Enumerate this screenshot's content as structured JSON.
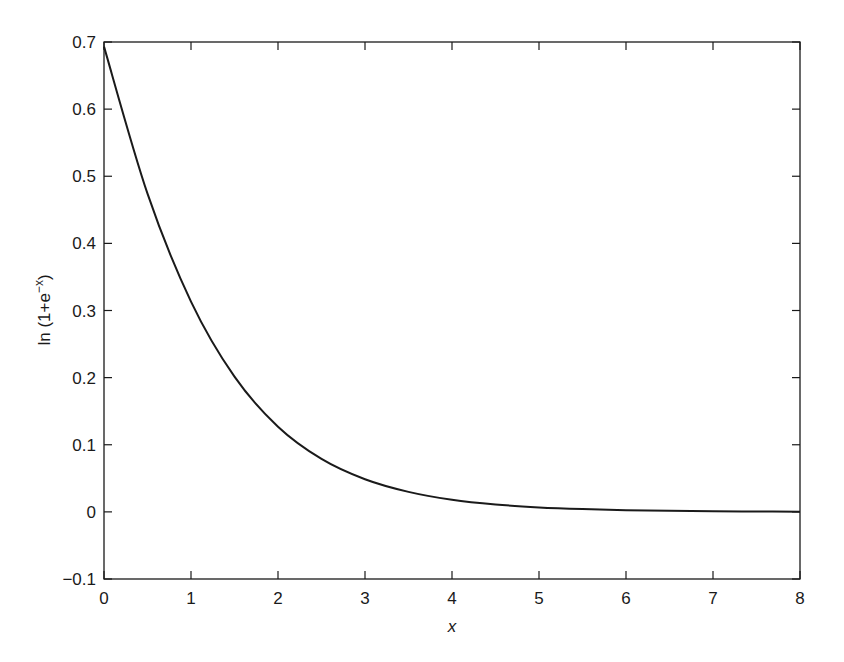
{
  "chart_data": {
    "type": "line",
    "title": "",
    "xlabel": "x",
    "ylabel": "ln (1+e^{-x})",
    "ylabel_parts": {
      "base": "ln (1+e",
      "sup": "−x",
      "close": ")"
    },
    "xlim": [
      0,
      8
    ],
    "ylim": [
      -0.1,
      0.7
    ],
    "x_ticks": [
      0,
      1,
      2,
      3,
      4,
      5,
      6,
      7,
      8
    ],
    "x_tick_labels": [
      "0",
      "1",
      "2",
      "3",
      "4",
      "5",
      "6",
      "7",
      "8"
    ],
    "y_ticks": [
      -0.1,
      0,
      0.1,
      0.2,
      0.3,
      0.4,
      0.5,
      0.6,
      0.7
    ],
    "y_tick_labels": [
      "−0.1",
      "0",
      "0.1",
      "0.2",
      "0.3",
      "0.4",
      "0.5",
      "0.6",
      "0.7"
    ],
    "grid": false,
    "legend": null,
    "line_color": "#1a1a1a",
    "series": [
      {
        "name": "ln(1+e^-x)",
        "x": [
          0,
          0.5,
          1,
          1.5,
          2,
          2.5,
          3,
          3.5,
          4,
          4.5,
          5,
          5.5,
          6,
          6.5,
          7,
          7.5,
          8
        ],
        "values": [
          0.6931,
          0.4741,
          0.3133,
          0.2014,
          0.1269,
          0.0789,
          0.0486,
          0.0298,
          0.0181,
          0.011,
          0.0067,
          0.0041,
          0.0025,
          0.0015,
          0.0009,
          0.0006,
          0.0003
        ]
      }
    ]
  }
}
